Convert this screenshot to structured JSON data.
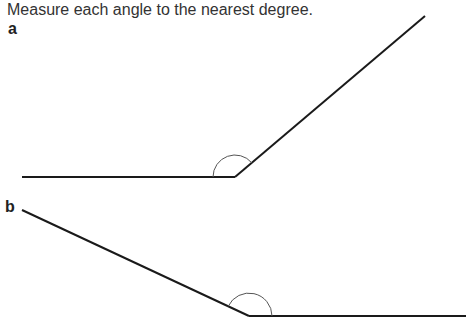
{
  "instruction": "Measure each angle to the nearest degree.",
  "angles": [
    {
      "label": "a",
      "vertex": [
        235,
        177
      ],
      "ray1_end": [
        22,
        177
      ],
      "ray2_end": [
        425,
        16
      ],
      "arc_radius": 22
    },
    {
      "label": "b",
      "vertex": [
        249,
        316
      ],
      "ray1_end": [
        22,
        210
      ],
      "ray2_end": [
        466,
        316
      ],
      "arc_radius": 23
    }
  ],
  "colors": {
    "line": "#1a1a1a",
    "arc": "#555555"
  }
}
